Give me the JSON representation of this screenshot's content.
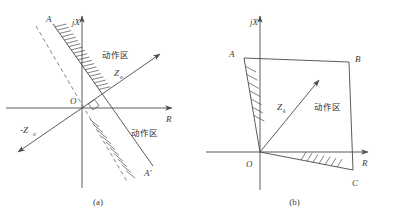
{
  "figure": {
    "type": "diagram",
    "panels": [
      {
        "id": "a",
        "caption": "(a)",
        "axes": {
          "real_label": "R",
          "imag_label": "jX",
          "origin_label": "O"
        },
        "labels": {
          "line_top": "A",
          "line_bottom": "A'",
          "vector_forward": "Z",
          "vector_forward_sub": "o",
          "vector_reverse": "-Z",
          "vector_reverse_sub": "o",
          "zone_upper": "动作区",
          "zone_lower": "动作区"
        },
        "elements": [
          "solid line A-A' through origin",
          "dashed line parallel to A-A' offset to the left",
          "hatching on right side of segment OA",
          "hatching on lower side of segment OA'",
          "arrow vector Zo into first quadrant",
          "arrow vector -Zo into third quadrant",
          "right-angle square marker at origin between Zo and AA'"
        ]
      },
      {
        "id": "b",
        "caption": "(b)",
        "axes": {
          "real_label": "R",
          "imag_label": "jX",
          "origin_label": "O"
        },
        "labels": {
          "vertex_upper_left": "A",
          "vertex_upper_right": "B",
          "vertex_lower_right": "C",
          "vector": "Z",
          "vector_sub": "k",
          "zone": "动作区"
        },
        "elements": [
          "quadrilateral O-A-B-C operating region",
          "hatching inside along edge OA",
          "hatching inside along edge OC",
          "arrow vector Zk from origin into the region"
        ]
      }
    ]
  },
  "colors": {
    "stroke": "#4a4a4a",
    "text": "#3a3a3a",
    "background": "#ffffff"
  }
}
